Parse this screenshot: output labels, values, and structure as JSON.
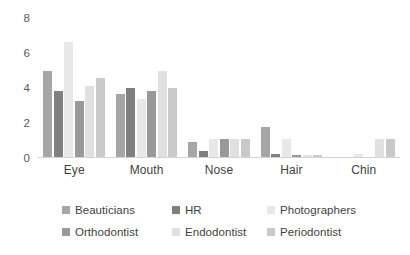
{
  "chart_data": {
    "type": "bar",
    "title": "",
    "xlabel": "",
    "ylabel": "",
    "ylim": [
      0,
      8
    ],
    "yticks": [
      "0",
      "2",
      "4",
      "6",
      "8"
    ],
    "grid": false,
    "legend_position": "bottom",
    "categories": [
      "Eye",
      "Mouth",
      "Nose",
      "Hair",
      "Chin"
    ],
    "series": [
      {
        "name": "Beauticians",
        "color": "#a6a6a6",
        "values": [
          4.95,
          3.65,
          0.9,
          1.8,
          0.0
        ]
      },
      {
        "name": "HR",
        "color": "#808080",
        "values": [
          3.85,
          4.0,
          0.4,
          0.25,
          0.0
        ]
      },
      {
        "name": "Photographers",
        "color": "#e8e8e8",
        "values": [
          6.65,
          3.35,
          1.1,
          1.1,
          0.25
        ]
      },
      {
        "name": "Orthodontist",
        "color": "#999999",
        "values": [
          3.25,
          3.85,
          1.1,
          0.2,
          0.0
        ]
      },
      {
        "name": "Endodontist",
        "color": "#e0e0e0",
        "values": [
          4.1,
          5.0,
          1.1,
          0.15,
          1.1
        ]
      },
      {
        "name": "Periodontist",
        "color": "#c9c9c9",
        "values": [
          4.6,
          4.0,
          1.1,
          0.15,
          1.1
        ]
      }
    ]
  },
  "axis": {
    "y_ticks": [
      "8",
      "6",
      "4",
      "2",
      "0"
    ]
  },
  "x_labels": [
    "Eye",
    "Mouth",
    "Nose",
    "Hair",
    "Chin"
  ],
  "legend": {
    "items": [
      {
        "label": "Beauticians",
        "color": "#a6a6a6"
      },
      {
        "label": "HR",
        "color": "#808080"
      },
      {
        "label": "Photographers",
        "color": "#e8e8e8"
      },
      {
        "label": "Orthodontist",
        "color": "#999999"
      },
      {
        "label": "Endodontist",
        "color": "#e0e0e0"
      },
      {
        "label": "Periodontist",
        "color": "#c9c9c9"
      }
    ]
  }
}
